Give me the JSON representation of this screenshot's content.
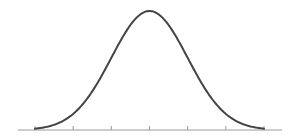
{
  "chart_data": {
    "type": "line",
    "title": "",
    "subtitle": "",
    "xlabel": "",
    "ylabel": "",
    "distribution": {
      "name": "normal",
      "mean": 0,
      "sd": 1
    },
    "x": [
      -3,
      -2.5,
      -2,
      -1.5,
      -1,
      -0.5,
      0,
      0.5,
      1,
      1.5,
      2,
      2.5,
      3
    ],
    "series": [
      {
        "name": "density",
        "values": [
          0.0044,
          0.0175,
          0.054,
          0.1295,
          0.242,
          0.3521,
          0.3989,
          0.3521,
          0.242,
          0.1295,
          0.054,
          0.0175,
          0.0044
        ]
      }
    ],
    "x_ticks": [
      -3,
      -2,
      -1,
      0,
      1,
      2,
      3
    ],
    "tick_labels": [],
    "xlim": [
      -3.45,
      3.5
    ],
    "ylim": [
      0,
      0.4
    ],
    "grid": false,
    "legend": null,
    "colors": {
      "curve": "#444444",
      "axis": "#9a9a9a",
      "tick": "#9a9a9a"
    }
  }
}
